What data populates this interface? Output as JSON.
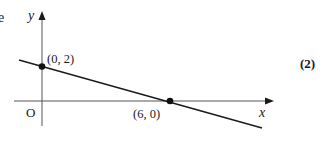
{
  "page": {
    "partial_text": "e",
    "marks": "(2)"
  },
  "diagram": {
    "axes": {
      "x_label": "x",
      "y_label": "y",
      "origin_label": "O"
    },
    "points": [
      {
        "label": "(0, 2)",
        "x": 0,
        "y": 2
      },
      {
        "label": "(6, 0)",
        "x": 6,
        "y": 0
      }
    ],
    "line": {
      "description": "straight line through (0, 2) and (6, 0)",
      "slope": "-1/3",
      "y_intercept": 2,
      "x_intercept": 6
    },
    "colors": {
      "ink": "#1a1a1a",
      "axis": "#555555",
      "background": "#ffffff"
    }
  }
}
